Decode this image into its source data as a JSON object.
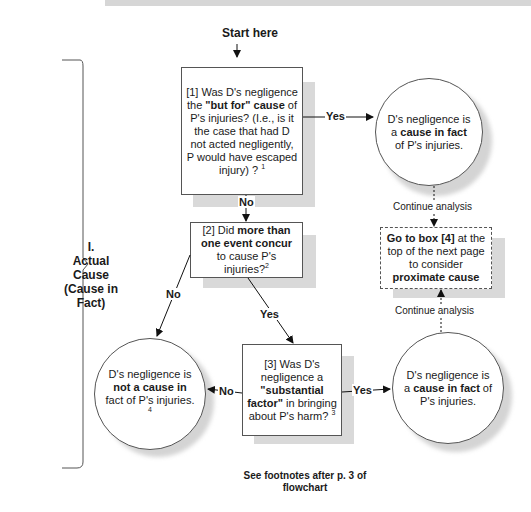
{
  "start_label": "Start here",
  "section": {
    "number": "I.",
    "title_line1": "Actual",
    "title_line2": "Cause",
    "title_line3": "(Cause in",
    "title_line4": "Fact)"
  },
  "box1": {
    "id": "[1]",
    "text_a": " Was D's negligence the ",
    "text_b": "\"but for\" cause",
    "text_c": " of P's injuries? (I.e., is it the case that had D not acted negligently, P would have escaped injury) ? ",
    "footnote": "1"
  },
  "box2": {
    "id": "[2]",
    "text_a": " Did ",
    "text_b": "more than one event concur",
    "text_c": " to cause P's injuries?",
    "footnote": "2"
  },
  "box3": {
    "id": "[3]",
    "text_a": " Was D's negligence a ",
    "text_b": "\"substantial factor\"",
    "text_c": " in bringing about P's harm? ",
    "footnote": "3"
  },
  "box4": {
    "text_a": "Go to box [4]",
    "text_b": " at the top of the next page to consider ",
    "text_c": "proximate cause"
  },
  "circle_yes1": {
    "text_a": "D's negligence is a ",
    "text_b": "cause in fact",
    "text_c": " of P's injuries."
  },
  "circle_yes3": {
    "text_a": "D's negligence is a ",
    "text_b": "cause in fact",
    "text_c": " of P's injuries."
  },
  "circle_no": {
    "text_a": "D's negligence is ",
    "text_b": "not a cause in",
    "text_c": " fact of P's injuries. ",
    "footnote": "4"
  },
  "edges": {
    "b1_yes": "Yes",
    "b1_no": "No",
    "b2_no": "No",
    "b2_yes": "Yes",
    "b3_no": "No",
    "b3_yes": "Yes",
    "continue_top": "Continue analysis",
    "continue_bottom": "Continue analysis"
  },
  "footer": "See footnotes after p. 3 of flowchart"
}
